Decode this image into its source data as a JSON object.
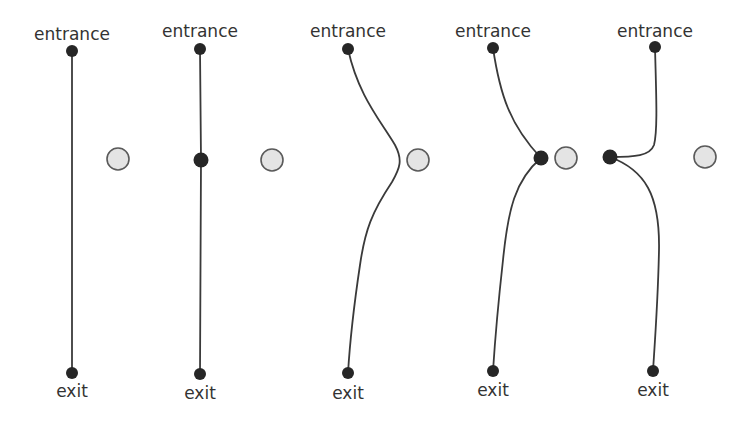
{
  "diagram": {
    "title": "",
    "colors": {
      "path": "#3a3a3a",
      "node": "#262626",
      "obstacle_fill": "#e4e4e4",
      "obstacle_stroke": "#5a5a5a",
      "label": "#333333"
    },
    "panels": [
      {
        "entrance_label": "entrance",
        "exit_label": "exit",
        "entrance": {
          "x": 72,
          "y": 51
        },
        "exit": {
          "x": 72,
          "y": 373
        },
        "waypoint": null,
        "obstacle": {
          "x": 118,
          "y": 159,
          "r": 11
        },
        "path_d": "M72 51 L72 373",
        "entrance_label_pos": {
          "x": 72,
          "y": 40
        },
        "exit_label_pos": {
          "x": 72,
          "y": 397
        }
      },
      {
        "entrance_label": "entrance",
        "exit_label": "exit",
        "entrance": {
          "x": 200,
          "y": 49
        },
        "exit": {
          "x": 200,
          "y": 374
        },
        "waypoint": {
          "x": 201,
          "y": 160
        },
        "obstacle": {
          "x": 272,
          "y": 160,
          "r": 11
        },
        "path_d": "M200 49 L201 160 L200 374",
        "entrance_label_pos": {
          "x": 200,
          "y": 37
        },
        "exit_label_pos": {
          "x": 200,
          "y": 399
        }
      },
      {
        "entrance_label": "entrance",
        "exit_label": "exit",
        "entrance": {
          "x": 348,
          "y": 49
        },
        "exit": {
          "x": 348,
          "y": 373
        },
        "waypoint": null,
        "obstacle": {
          "x": 418,
          "y": 160,
          "r": 11
        },
        "path_d": "M348 49 C358 95, 380 120, 395 145 C403 160, 400 168, 392 182 C372 212, 365 230, 360 265 C354 305, 350 340, 348 373",
        "entrance_label_pos": {
          "x": 348,
          "y": 37
        },
        "exit_label_pos": {
          "x": 348,
          "y": 399
        }
      },
      {
        "entrance_label": "entrance",
        "exit_label": "exit",
        "entrance": {
          "x": 493,
          "y": 48
        },
        "exit": {
          "x": 493,
          "y": 371
        },
        "waypoint": {
          "x": 541,
          "y": 158
        },
        "obstacle": {
          "x": 566,
          "y": 158,
          "r": 11
        },
        "path_d": "M493 48 C500 95, 510 125, 541 158 C515 180, 508 210, 503 260 C498 305, 495 340, 493 371",
        "entrance_label_pos": {
          "x": 493,
          "y": 37
        },
        "exit_label_pos": {
          "x": 493,
          "y": 396
        }
      },
      {
        "entrance_label": "entrance",
        "exit_label": "exit",
        "entrance": {
          "x": 655,
          "y": 47
        },
        "exit": {
          "x": 653,
          "y": 371
        },
        "waypoint": {
          "x": 610,
          "y": 157
        },
        "obstacle": {
          "x": 705,
          "y": 157,
          "r": 11
        },
        "path_d": "M655 47 C656 90, 658 130, 654 145 C650 156, 635 157, 610 157 C645 170, 660 195, 659 250 C658 300, 655 340, 653 371",
        "entrance_label_pos": {
          "x": 655,
          "y": 37
        },
        "exit_label_pos": {
          "x": 653,
          "y": 396
        }
      }
    ]
  }
}
